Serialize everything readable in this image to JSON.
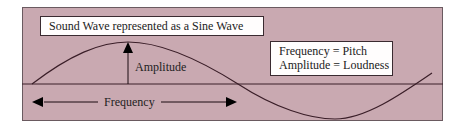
{
  "title": "Sound Wave represented as a Sine Wave",
  "legend": {
    "line1": "Frequency = Pitch",
    "line2": "Amplitude = Loudness"
  },
  "labels": {
    "amplitude": "Amplitude",
    "frequency": "Frequency"
  },
  "colors": {
    "panel_background": "#c9a9b1",
    "wave": "#3a1e28",
    "box_background": "#fffdfd"
  }
}
